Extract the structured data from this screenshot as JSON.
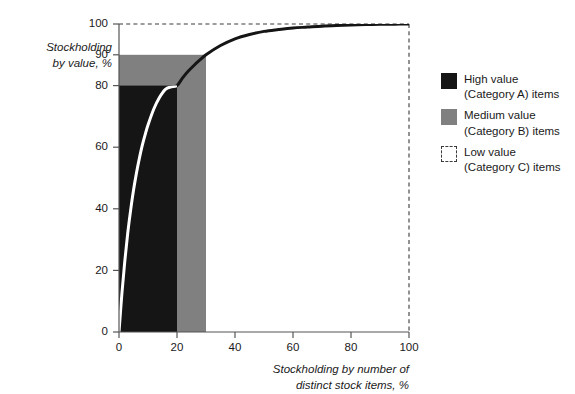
{
  "chart_data": {
    "type": "line",
    "title": "",
    "subtitle": "",
    "xlabel": "Stockholding by number of\ndistinct stock items, %",
    "ylabel": "Stockholding\nby value, %",
    "xlim": [
      0,
      100
    ],
    "ylim": [
      0,
      100
    ],
    "grid": false,
    "xticks": [
      0,
      20,
      40,
      60,
      80,
      100
    ],
    "xtick_labels": [
      "0",
      "20",
      "40",
      "60",
      "80",
      "100"
    ],
    "yticks": [
      0,
      20,
      40,
      60,
      80,
      90,
      100
    ],
    "ytick_labels": [
      "0",
      "20",
      "40",
      "60",
      "80",
      "90",
      "100"
    ],
    "legend_position": "right",
    "series": [
      {
        "name": "Cumulative stockholding value curve",
        "type": "line",
        "color": "#151515",
        "overlay_color_on_black_region": "#ffffff",
        "x": [
          0,
          1,
          2,
          3,
          4,
          5,
          6,
          7,
          8,
          9,
          10,
          12,
          14,
          16,
          18,
          20,
          22,
          24,
          26,
          28,
          30,
          35,
          40,
          45,
          50,
          55,
          60,
          65,
          70,
          75,
          80,
          85,
          90,
          95,
          100
        ],
        "y": [
          0,
          12.5,
          23.0,
          32.0,
          39.5,
          46.0,
          51.5,
          56.3,
          60.5,
          64.0,
          67.2,
          72.4,
          76.2,
          78.8,
          79.6,
          80.0,
          82.6,
          84.8,
          86.7,
          88.4,
          90.0,
          93.0,
          95.2,
          96.6,
          97.6,
          98.2,
          98.7,
          99.0,
          99.3,
          99.5,
          99.65,
          99.8,
          99.9,
          99.95,
          100
        ]
      }
    ],
    "regions": [
      {
        "name": "High value (Category A) items",
        "x_range": [
          0,
          20
        ],
        "y_range": [
          0,
          80
        ],
        "color": "#151515"
      },
      {
        "name": "Medium value (Category B) items",
        "x_range": [
          0,
          30
        ],
        "y_range": [
          0,
          90
        ],
        "color": "#808080"
      },
      {
        "name": "Low value (Category C) items",
        "x_range": [
          0,
          100
        ],
        "y_range": [
          0,
          100
        ],
        "color": "#ffffff",
        "border": "dashed"
      }
    ],
    "annotations": [
      {
        "text": "Pareto / ABC analysis curve reaching 80% of value at 20% of items and 90% of value at 30% of items"
      }
    ]
  },
  "axes": {
    "y_title": "Stockholding\nby value, %",
    "x_title": "Stockholding by number of\ndistinct stock items, %",
    "y_tick_labels": [
      "100",
      "90",
      "80",
      "60",
      "40",
      "20",
      "0"
    ],
    "x_tick_labels": [
      "0",
      "20",
      "40",
      "60",
      "80",
      "100"
    ]
  },
  "legend": {
    "items": [
      {
        "swatch": "filled-black-swatch",
        "label": "High value\n(Category A) items",
        "color": "#151515"
      },
      {
        "swatch": "filled-grey-swatch",
        "label": "Medium value\n(Category B) items",
        "color": "#808080"
      },
      {
        "swatch": "dashed-outline-swatch",
        "label": "Low value\n(Category C) items",
        "color": "#ffffff"
      }
    ]
  },
  "colors": {
    "high_value": "#151515",
    "medium_value": "#808080",
    "low_value": "#ffffff",
    "axis": "#555555",
    "curve_light": "#ffffff",
    "background": "#ffffff"
  }
}
